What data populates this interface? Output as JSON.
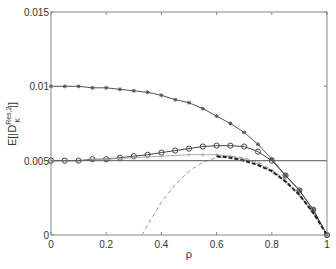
{
  "chart_data": {
    "type": "line",
    "title": "",
    "xlabel": "ρ",
    "ylabel": "E[|D_K^{Res,2}|]",
    "ylabel_parts": {
      "base": "E[|D",
      "sup": "Res,2",
      "sub": "K",
      "tail": "|]"
    },
    "xlim": [
      0,
      1
    ],
    "ylim": [
      0,
      0.015
    ],
    "x_ticks": [
      "0",
      "0.2",
      "0.4",
      "0.6",
      "0.8",
      "1"
    ],
    "y_ticks": [
      "0",
      "0.005",
      "0.01",
      "0.015"
    ],
    "grid": false,
    "legend": null,
    "series": [
      {
        "name": "asterisk-series",
        "style": "solid",
        "color": "#555555",
        "marker": "asterisk",
        "x": [
          0,
          0.05,
          0.1,
          0.15,
          0.2,
          0.25,
          0.3,
          0.35,
          0.4,
          0.45,
          0.5,
          0.55,
          0.6,
          0.65,
          0.7,
          0.75,
          0.8,
          0.85,
          0.9,
          0.95,
          1.0
        ],
        "y": [
          0.01,
          0.01,
          0.01,
          0.0099,
          0.0099,
          0.0098,
          0.0097,
          0.0096,
          0.0094,
          0.0091,
          0.0089,
          0.0085,
          0.008,
          0.0075,
          0.0069,
          0.0061,
          0.0051,
          0.004,
          0.003,
          0.0017,
          0.0
        ]
      },
      {
        "name": "circle-series",
        "style": "solid",
        "color": "#444444",
        "marker": "circle",
        "x": [
          0,
          0.05,
          0.1,
          0.15,
          0.2,
          0.25,
          0.3,
          0.35,
          0.4,
          0.45,
          0.5,
          0.55,
          0.6,
          0.65,
          0.7,
          0.75,
          0.8,
          0.85,
          0.9,
          0.95,
          1.0
        ],
        "y": [
          0.005,
          0.005,
          0.005,
          0.0051,
          0.0051,
          0.0052,
          0.0053,
          0.0054,
          0.00554,
          0.00568,
          0.00581,
          0.00595,
          0.00601,
          0.00601,
          0.00595,
          0.00561,
          0.005,
          0.004,
          0.003,
          0.0017,
          0.0
        ]
      },
      {
        "name": "plus-series",
        "style": "solid",
        "color": "#aaaaaa",
        "marker": "plus",
        "x": [
          0,
          0.1,
          0.2,
          0.3,
          0.4,
          0.5,
          0.55,
          0.6,
          0.65,
          0.7,
          0.75,
          0.8,
          0.85,
          0.9,
          0.95,
          1.0
        ],
        "y": [
          0.005,
          0.005,
          0.0051,
          0.0052,
          0.0053,
          0.0054,
          0.0054,
          0.0054,
          0.0053,
          0.0051,
          0.0048,
          0.0043,
          0.0036,
          0.0027,
          0.0015,
          0.0
        ]
      },
      {
        "name": "gray-dashed-series",
        "style": "dashed",
        "color": "#999999",
        "marker": "none",
        "x": [
          0.33,
          0.36,
          0.4,
          0.45,
          0.5,
          0.55,
          0.6,
          0.65,
          0.7,
          0.75,
          0.8,
          0.85,
          0.9,
          0.95,
          1.0
        ],
        "y": [
          0.0,
          0.001,
          0.0022,
          0.0034,
          0.0043,
          0.0049,
          0.0052,
          0.0053,
          0.0052,
          0.0049,
          0.0044,
          0.0037,
          0.0027,
          0.0015,
          0.0
        ]
      },
      {
        "name": "black-dashed-series",
        "style": "dashed-thick",
        "color": "#222222",
        "marker": "none",
        "x": [
          0.6,
          0.65,
          0.7,
          0.75,
          0.8,
          0.85,
          0.9,
          0.95,
          1.0
        ],
        "y": [
          0.0053,
          0.0052,
          0.005,
          0.0047,
          0.0043,
          0.0036,
          0.0027,
          0.0015,
          0.0
        ]
      },
      {
        "name": "horizontal-reference",
        "style": "solid",
        "color": "#555555",
        "marker": "none",
        "x": [
          0,
          1
        ],
        "y": [
          0.005,
          0.005
        ]
      }
    ]
  }
}
